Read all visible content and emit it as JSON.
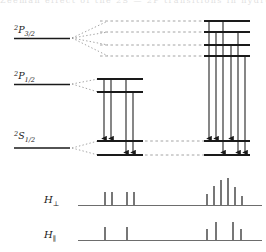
{
  "figure": {
    "background": "#ffffff",
    "ink": "#1a1a1a",
    "dash_color": "#8d8d8d",
    "width": 266,
    "height": 252
  },
  "top_cut_text": {
    "fragment": "Zeeman effect of the 2S — 2P  transitions in  hydrogen"
  },
  "levels": [
    {
      "id": "2P32",
      "label_n": "2",
      "label_term": "P",
      "label_j": "3/2",
      "label_full": "2P3/2",
      "y": 38,
      "unsplit_x1": 14,
      "unsplit_x2": 70,
      "sublevels": 4,
      "sublevel_ys": [
        21,
        32,
        45,
        56
      ],
      "split_x1": 204,
      "split_x2": 250,
      "m_values": [
        "+3/2",
        "+1/2",
        "-1/2",
        "-3/2"
      ]
    },
    {
      "id": "2P12",
      "label_n": "2",
      "label_term": "P",
      "label_j": "1/2",
      "label_full": "2P1/2",
      "y": 84,
      "unsplit_x1": 14,
      "unsplit_x2": 70,
      "sublevels": 2,
      "sublevel_ys": [
        79,
        92
      ],
      "split_x1": 97,
      "split_x2": 143,
      "m_values": [
        "+1/2",
        "-1/2"
      ]
    },
    {
      "id": "2S12",
      "label_n": "2",
      "label_term": "S",
      "label_j": "1/2",
      "label_full": "2S1/2",
      "y": 144,
      "unsplit_x1": 14,
      "unsplit_x2": 70,
      "sublevels": 2,
      "sublevel_ys": [
        141,
        155
      ],
      "split_groups": [
        {
          "x1": 97,
          "x2": 143
        },
        {
          "x1": 204,
          "x2": 250
        }
      ],
      "m_values": [
        "+1/2",
        "-1/2"
      ]
    }
  ],
  "transitions": {
    "from_2P12": {
      "count": 4,
      "arrow_xs": [
        104,
        111,
        126,
        133
      ],
      "start_ys": [
        79,
        79,
        92,
        92
      ],
      "end_ys": [
        141,
        141,
        155,
        155
      ]
    },
    "from_2P32": {
      "count": 6,
      "arrow_xs": [
        209,
        216,
        223,
        231,
        238,
        245
      ],
      "start_ys": [
        21,
        32,
        45,
        21,
        32,
        45
      ],
      "end_ys": [
        141,
        141,
        141,
        155,
        155,
        155
      ]
    }
  },
  "spectra": [
    {
      "id": "H-perp",
      "label": "H",
      "label_sub": "⊥",
      "baseline_y": 205,
      "axis_x1": 78,
      "axis_x2": 262,
      "lines": [
        {
          "x": 105,
          "height": 13
        },
        {
          "x": 112,
          "height": 13
        },
        {
          "x": 127,
          "height": 13
        },
        {
          "x": 134,
          "height": 13
        },
        {
          "x": 207,
          "height": 11
        },
        {
          "x": 214,
          "height": 19
        },
        {
          "x": 221,
          "height": 25
        },
        {
          "x": 228,
          "height": 27
        },
        {
          "x": 235,
          "height": 18
        },
        {
          "x": 242,
          "height": 9
        }
      ]
    },
    {
      "id": "H-par",
      "label": "H",
      "label_sub": "∥",
      "baseline_y": 240,
      "axis_x1": 78,
      "axis_x2": 262,
      "lines": [
        {
          "x": 105,
          "height": 13
        },
        {
          "x": 127,
          "height": 13
        },
        {
          "x": 207,
          "height": 11
        },
        {
          "x": 216,
          "height": 18
        },
        {
          "x": 233,
          "height": 18
        },
        {
          "x": 241,
          "height": 11
        }
      ]
    }
  ]
}
